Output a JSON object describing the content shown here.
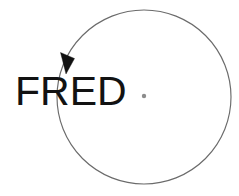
{
  "diagram": {
    "background_color": "#ffffff",
    "label": {
      "text": "FRED",
      "color": "#121212",
      "font_size_px": 41,
      "x": 15,
      "baseline_y": 105
    },
    "circle": {
      "name": "orbit-circle",
      "center_x": 144,
      "center_y": 97,
      "radius": 87,
      "stroke_color": "#6b6b6b",
      "stroke_width": 1.15,
      "fill": "none"
    },
    "center_point": {
      "name": "center-dot",
      "x": 144,
      "y": 96,
      "radius": 2.2,
      "color": "#8c8c8c"
    },
    "direction_arrow": {
      "name": "counterclockwise-arrow",
      "direction": "counterclockwise",
      "color": "#111111",
      "tip_x": 66,
      "tip_y": 74,
      "points": "66,74 60.5,52.5 74.5,58.5"
    }
  }
}
